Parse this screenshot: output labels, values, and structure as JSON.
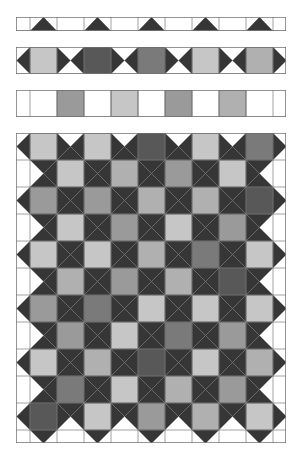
{
  "palette": {
    "background": "#ffffff",
    "triangle": "#363636",
    "grid_line": "#8a8a8a",
    "outline": "#6e6e6e",
    "shades": {
      "L": "#c6c6c6",
      "LM": "#b0b0b0",
      "M": "#9a9a9a",
      "MD": "#7a7a7a",
      "D": "#585858"
    }
  },
  "columns": {
    "edges": [
      16,
      30,
      57,
      84,
      111,
      138,
      165,
      192,
      219,
      246,
      273,
      286
    ]
  },
  "strips": [
    {
      "name": "strip-top-triangles",
      "y": 17,
      "height": 14,
      "kind": "half-up",
      "cells": [
        1,
        3,
        5,
        7,
        9
      ]
    },
    {
      "name": "strip-horizontal-bowties",
      "y": 47,
      "height": 27,
      "kind": "squares-lr",
      "cells": [
        1,
        3,
        5,
        7,
        9
      ],
      "shades": [
        "L",
        "D",
        "MD",
        "L",
        "LM"
      ]
    },
    {
      "name": "strip-vertical-bowties",
      "y": 90,
      "height": 27,
      "kind": "squares-ud",
      "cells": [
        2,
        4,
        6,
        8
      ],
      "shades": [
        "M",
        "L",
        "M",
        "LM"
      ]
    }
  ],
  "main_grid": {
    "y": 133,
    "row_height": 27,
    "bottom_half_row": 13,
    "rows": [
      {
        "cells": [
          1,
          3,
          5,
          7,
          9
        ],
        "shades": [
          "L",
          "L",
          "D",
          "L",
          "MD"
        ]
      },
      {
        "cells": [
          2,
          4,
          6,
          8
        ],
        "shades": [
          "L",
          "LM",
          "M",
          "L"
        ]
      },
      {
        "cells": [
          1,
          3,
          5,
          7,
          9
        ],
        "shades": [
          "M",
          "M",
          "LM",
          "LM",
          "D"
        ]
      },
      {
        "cells": [
          2,
          4,
          6,
          8
        ],
        "shades": [
          "L",
          "M",
          "L",
          "M"
        ]
      },
      {
        "cells": [
          1,
          3,
          5,
          7,
          9
        ],
        "shades": [
          "L",
          "L",
          "LM",
          "MD",
          "L"
        ]
      },
      {
        "cells": [
          2,
          4,
          6,
          8
        ],
        "shades": [
          "LM",
          "M",
          "LM",
          "D"
        ]
      },
      {
        "cells": [
          1,
          3,
          5,
          7,
          9
        ],
        "shades": [
          "M",
          "MD",
          "L",
          "L",
          "L"
        ]
      },
      {
        "cells": [
          2,
          4,
          6,
          8
        ],
        "shades": [
          "M",
          "L",
          "MD",
          "M"
        ]
      },
      {
        "cells": [
          1,
          3,
          5,
          7,
          9
        ],
        "shades": [
          "L",
          "LM",
          "D",
          "L",
          "LM"
        ]
      },
      {
        "cells": [
          2,
          4,
          6,
          8
        ],
        "shades": [
          "MD",
          "L",
          "LM",
          "M"
        ]
      },
      {
        "cells": [
          1,
          3,
          5,
          7,
          9
        ],
        "shades": [
          "D",
          "L",
          "M",
          "LM",
          "L"
        ]
      }
    ]
  }
}
